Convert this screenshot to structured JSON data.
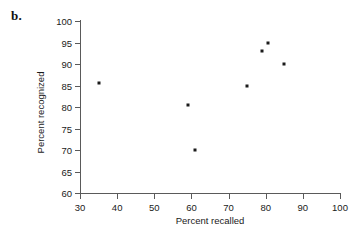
{
  "panel": {
    "label": "b."
  },
  "chart_data": {
    "type": "scatter",
    "title": "",
    "xlabel": "Percent recalled",
    "ylabel": "Percent recognized",
    "xlim": [
      30,
      100
    ],
    "ylim": [
      60,
      100
    ],
    "xticks": [
      30,
      40,
      50,
      60,
      70,
      80,
      90,
      100
    ],
    "yticks": [
      60,
      65,
      70,
      75,
      80,
      85,
      90,
      95,
      100
    ],
    "xtick_labels": [
      "30",
      "40",
      "50",
      "60",
      "70",
      "80",
      "90",
      "100"
    ],
    "ytick_labels": [
      "60",
      "65",
      "70",
      "75",
      "80",
      "85",
      "90",
      "95",
      "100"
    ],
    "grid": false,
    "legend": null,
    "marker_color": "#1b1b1b",
    "axis_color": "#5a5a5a",
    "points": [
      {
        "x": 35.0,
        "y": 85.5
      },
      {
        "x": 59.0,
        "y": 80.5
      },
      {
        "x": 61.0,
        "y": 70.0
      },
      {
        "x": 75.0,
        "y": 85.0
      },
      {
        "x": 79.0,
        "y": 93.0
      },
      {
        "x": 80.5,
        "y": 95.0
      },
      {
        "x": 85.0,
        "y": 90.0
      }
    ]
  }
}
